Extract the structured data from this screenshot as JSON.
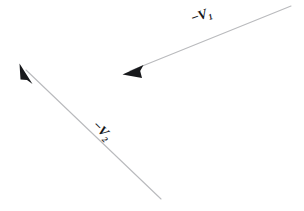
{
  "figure": {
    "background_color": "#ffffff",
    "width": 304,
    "height": 211,
    "line_color": "#b9babd",
    "arrowhead_color": "#17181b",
    "line_width": 1.1
  },
  "vectors": [
    {
      "name": "vector-v1",
      "label_minus": "−",
      "label_symbol": "V",
      "label_subscript": "1",
      "label_full": "−V₁",
      "tail_x": 291,
      "tail_y": 6,
      "head_x": 123,
      "head_y": 74,
      "angle_deg": -22,
      "label_rotation_deg": -20
    },
    {
      "name": "vector-v2",
      "label_minus": "−",
      "label_symbol": "V",
      "label_subscript": "2",
      "label_full": "−V₂",
      "tail_x": 161,
      "tail_y": 199,
      "head_x": 20,
      "head_y": 64,
      "angle_deg": 224,
      "label_rotation_deg": 45
    }
  ]
}
